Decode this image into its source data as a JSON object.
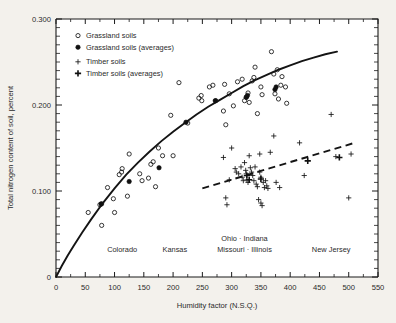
{
  "chart_data": {
    "type": "scatter",
    "title": "",
    "xlabel": "Humidity factor (N.S.Q.)",
    "ylabel": "Total nitrogen content of soil, percent",
    "xlim": [
      0,
      550
    ],
    "ylim": [
      0,
      0.3
    ],
    "xticks": [
      0,
      50,
      100,
      150,
      200,
      250,
      300,
      350,
      400,
      450,
      500,
      550
    ],
    "xticklabels": [
      "0",
      "50",
      "100",
      "150",
      "200",
      "250",
      "300",
      "350",
      "400",
      "450",
      "500",
      "550"
    ],
    "xminor_step": 25,
    "yticks": [
      0,
      0.1,
      0.2,
      0.3
    ],
    "yticklabels": [
      "0",
      "0.100",
      "0.200",
      "0.300"
    ],
    "yminor_step": 0.01,
    "grid": false,
    "legend_position": "upper-left",
    "legend": [
      {
        "key": "grassland",
        "label": "Grassland soils",
        "marker": "open-circle"
      },
      {
        "key": "grassland_avg",
        "label": "Grassland soils (averages)",
        "marker": "filled-circle"
      },
      {
        "key": "timber",
        "label": "Timber soils",
        "marker": "plus"
      },
      {
        "key": "timber_avg",
        "label": "Timber soils (averages)",
        "marker": "bold-plus"
      }
    ],
    "region_labels": [
      {
        "text": "Colorado",
        "x": 113,
        "y": 0.0285
      },
      {
        "text": "Kansas",
        "x": 203,
        "y": 0.0285
      },
      {
        "text": "Ohio · Indiana",
        "x": 322,
        "y": 0.0415
      },
      {
        "text": "Missouri · Illinois",
        "x": 322,
        "y": 0.0285
      },
      {
        "text": "New Jersey",
        "x": 470,
        "y": 0.0285
      }
    ],
    "series": [
      {
        "name": "Grassland soils",
        "marker": "open-circle",
        "points": [
          [
            55,
            0.075
          ],
          [
            75,
            0.084
          ],
          [
            78,
            0.085
          ],
          [
            78,
            0.06
          ],
          [
            88,
            0.104
          ],
          [
            98,
            0.091
          ],
          [
            100,
            0.075
          ],
          [
            108,
            0.119
          ],
          [
            112,
            0.122
          ],
          [
            113,
            0.126
          ],
          [
            122,
            0.094
          ],
          [
            125,
            0.143
          ],
          [
            143,
            0.12
          ],
          [
            147,
            0.112
          ],
          [
            158,
            0.115
          ],
          [
            162,
            0.131
          ],
          [
            166,
            0.134
          ],
          [
            170,
            0.105
          ],
          [
            175,
            0.15
          ],
          [
            182,
            0.141
          ],
          [
            196,
            0.188
          ],
          [
            200,
            0.141
          ],
          [
            210,
            0.226
          ],
          [
            225,
            0.179
          ],
          [
            244,
            0.208
          ],
          [
            248,
            0.211
          ],
          [
            249,
            0.205
          ],
          [
            262,
            0.221
          ],
          [
            268,
            0.223
          ],
          [
            273,
            0.205
          ],
          [
            286,
            0.193
          ],
          [
            288,
            0.224
          ],
          [
            290,
            0.177
          ],
          [
            296,
            0.213
          ],
          [
            303,
            0.199
          ],
          [
            310,
            0.227
          ],
          [
            318,
            0.23
          ],
          [
            322,
            0.205
          ],
          [
            325,
            0.209
          ],
          [
            328,
            0.214
          ],
          [
            330,
            0.203
          ],
          [
            335,
            0.228
          ],
          [
            338,
            0.232
          ],
          [
            340,
            0.244
          ],
          [
            344,
            0.19
          ],
          [
            350,
            0.221
          ],
          [
            352,
            0.212
          ],
          [
            368,
            0.262
          ],
          [
            372,
            0.236
          ],
          [
            374,
            0.213
          ],
          [
            378,
            0.241
          ],
          [
            380,
            0.207
          ],
          [
            384,
            0.223
          ],
          [
            386,
            0.233
          ],
          [
            392,
            0.221
          ],
          [
            394,
            0.202
          ]
        ]
      },
      {
        "name": "Grassland soils (averages)",
        "marker": "filled-circle",
        "points": [
          [
            77,
            0.085
          ],
          [
            125,
            0.111
          ],
          [
            176,
            0.127
          ],
          [
            222,
            0.18
          ],
          [
            272,
            0.205
          ],
          [
            325,
            0.209
          ],
          [
            327,
            0.211
          ],
          [
            374,
            0.218
          ],
          [
            376,
            0.221
          ]
        ]
      },
      {
        "name": "Timber soils",
        "marker": "plus",
        "points": [
          [
            286,
            0.139
          ],
          [
            290,
            0.092
          ],
          [
            292,
            0.084
          ],
          [
            296,
            0.113
          ],
          [
            300,
            0.15
          ],
          [
            306,
            0.126
          ],
          [
            308,
            0.122
          ],
          [
            312,
            0.12
          ],
          [
            316,
            0.128
          ],
          [
            318,
            0.116
          ],
          [
            320,
            0.112
          ],
          [
            322,
            0.133
          ],
          [
            324,
            0.124
          ],
          [
            325,
            0.12
          ],
          [
            326,
            0.113
          ],
          [
            328,
            0.11
          ],
          [
            330,
            0.141
          ],
          [
            332,
            0.127
          ],
          [
            334,
            0.122
          ],
          [
            336,
            0.118
          ],
          [
            338,
            0.112
          ],
          [
            340,
            0.128
          ],
          [
            342,
            0.108
          ],
          [
            344,
            0.105
          ],
          [
            346,
            0.09
          ],
          [
            348,
            0.143
          ],
          [
            348,
            0.122
          ],
          [
            350,
            0.116
          ],
          [
            350,
            0.086
          ],
          [
            352,
            0.083
          ],
          [
            354,
            0.11
          ],
          [
            356,
            0.104
          ],
          [
            358,
            0.112
          ],
          [
            360,
            0.106
          ],
          [
            362,
            0.103
          ],
          [
            366,
            0.145
          ],
          [
            372,
            0.164
          ],
          [
            376,
            0.11
          ],
          [
            382,
            0.104
          ],
          [
            416,
            0.156
          ],
          [
            424,
            0.118
          ],
          [
            470,
            0.189
          ],
          [
            478,
            0.14
          ],
          [
            500,
            0.092
          ],
          [
            504,
            0.143
          ]
        ]
      },
      {
        "name": "Timber soils (averages)",
        "marker": "bold-plus",
        "points": [
          [
            326,
            0.118
          ],
          [
            330,
            0.113
          ],
          [
            350,
            0.114
          ],
          [
            430,
            0.135
          ],
          [
            484,
            0.139
          ]
        ]
      }
    ],
    "trend_lines": [
      {
        "name": "Grassland trend",
        "style": "solid",
        "points": [
          [
            0,
            0.0
          ],
          [
            10,
            0.013
          ],
          [
            20,
            0.025
          ],
          [
            30,
            0.036
          ],
          [
            45,
            0.052
          ],
          [
            60,
            0.067
          ],
          [
            80,
            0.086
          ],
          [
            100,
            0.103
          ],
          [
            120,
            0.119
          ],
          [
            140,
            0.133
          ],
          [
            160,
            0.146
          ],
          [
            180,
            0.158
          ],
          [
            200,
            0.169
          ],
          [
            220,
            0.179
          ],
          [
            240,
            0.189
          ],
          [
            260,
            0.198
          ],
          [
            280,
            0.206
          ],
          [
            300,
            0.214
          ],
          [
            320,
            0.222
          ],
          [
            340,
            0.229
          ],
          [
            360,
            0.235
          ],
          [
            380,
            0.241
          ],
          [
            400,
            0.246
          ],
          [
            420,
            0.251
          ],
          [
            440,
            0.255
          ],
          [
            460,
            0.259
          ],
          [
            480,
            0.262
          ]
        ]
      },
      {
        "name": "Timber trend",
        "style": "dashed",
        "points": [
          [
            250,
            0.103
          ],
          [
            510,
            0.156
          ]
        ]
      }
    ]
  }
}
